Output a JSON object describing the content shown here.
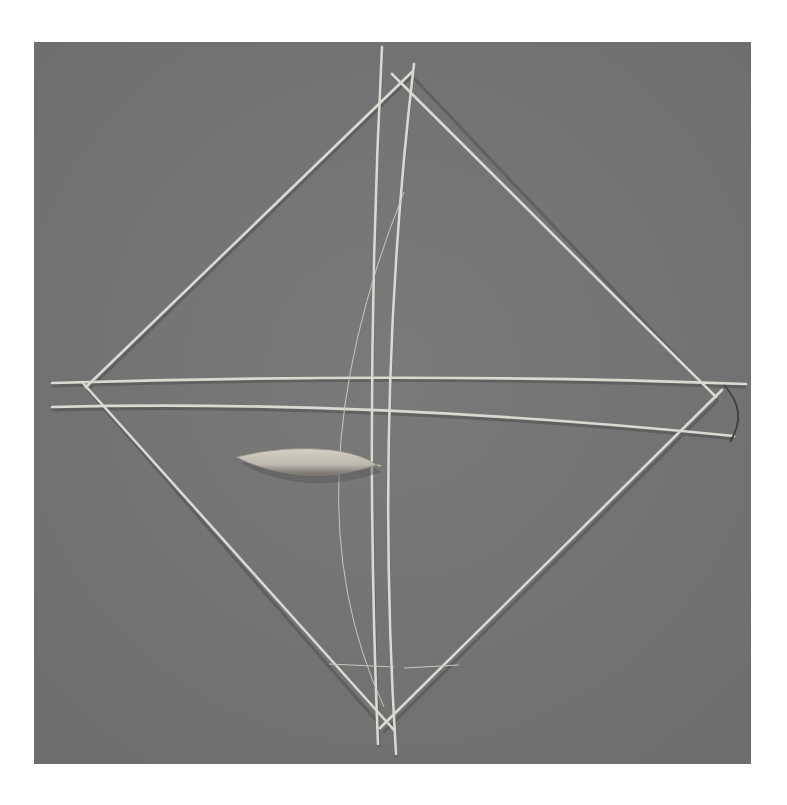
{
  "image": {
    "subject": "Stick kite frame sculpture with leaf on grey background",
    "description": "Diamond-shaped frame of thin sticks crossed at the top, bottom, left and right points, with two long curved vertical sticks, two curved horizontal sticks, a thin diagonal string and a single leaf resting on the left side.",
    "colors": {
      "page_background": "#ffffff",
      "photo_background": "#737373",
      "stick": "#d9d6cf",
      "stick_shadow": "#4a4a4a",
      "leaf_light": "#cfcac0",
      "leaf_dark": "#8f8b84"
    }
  }
}
